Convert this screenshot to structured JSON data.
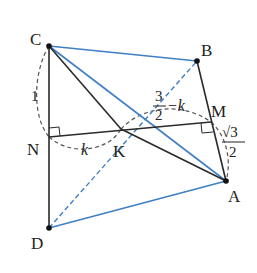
{
  "diagram": {
    "type": "geometry-3d-figure",
    "colors": {
      "black_line": "#2a2a2a",
      "blue_line": "#3f7fc4",
      "dashed": "#555555",
      "point": "#111111",
      "text": "#222222"
    },
    "points": {
      "C": {
        "label": "C",
        "x": 49,
        "y": 46
      },
      "B": {
        "label": "B",
        "x": 197,
        "y": 61
      },
      "M": {
        "label": "M",
        "x": 211,
        "y": 122
      },
      "A": {
        "label": "A",
        "x": 226,
        "y": 181
      },
      "N": {
        "label": "N",
        "x": 49,
        "y": 137
      },
      "K": {
        "label": "K",
        "x": 121,
        "y": 129
      },
      "D": {
        "label": "D",
        "x": 49,
        "y": 228
      }
    },
    "labels": {
      "C": "C",
      "B": "B",
      "M": "M",
      "A": "A",
      "N": "N",
      "K": "K",
      "D": "D",
      "len_CN": "1",
      "len_NK": "k",
      "len_KM_num": "3",
      "len_KM_den": "2",
      "len_KM_tail": "−k",
      "len_MA_num": "√3",
      "len_MA_den": "2"
    },
    "segments": [
      {
        "from": "C",
        "to": "D",
        "style": "solid",
        "color": "black"
      },
      {
        "from": "N",
        "to": "M",
        "style": "solid",
        "color": "black"
      },
      {
        "from": "C",
        "to": "K",
        "style": "solid",
        "color": "black"
      },
      {
        "from": "K",
        "to": "A",
        "style": "solid",
        "color": "black"
      },
      {
        "from": "B",
        "to": "A",
        "style": "solid",
        "color": "black"
      },
      {
        "from": "C",
        "to": "B",
        "style": "solid",
        "color": "blue"
      },
      {
        "from": "C",
        "to": "A",
        "style": "solid",
        "color": "blue"
      },
      {
        "from": "D",
        "to": "A",
        "style": "solid",
        "color": "blue"
      },
      {
        "from": "D",
        "to": "B",
        "style": "dashed",
        "color": "blue"
      }
    ],
    "right_angles": [
      "N",
      "M"
    ]
  }
}
